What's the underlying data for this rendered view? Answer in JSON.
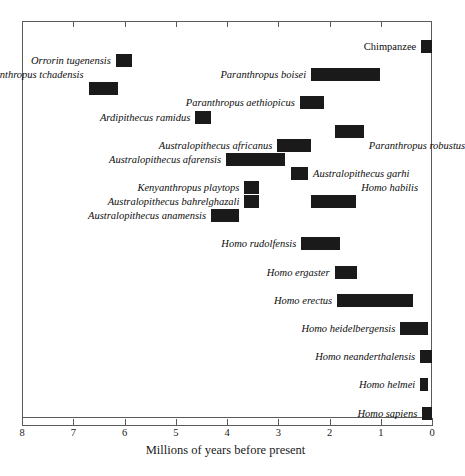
{
  "chart_data": {
    "type": "bar",
    "orientation": "horizontal",
    "title": "",
    "xlabel": "Millions of years before present",
    "ylabel": "",
    "xlim": [
      8,
      0
    ],
    "x_axis_reversed": true,
    "xticks": [
      8,
      7,
      6,
      5,
      4,
      3,
      2,
      1,
      0
    ],
    "xticklabels": [
      "8",
      "7",
      "6",
      "5",
      "4",
      "3",
      "2",
      "1",
      "0"
    ],
    "grid": false,
    "legend": null,
    "bar_color": "#1a1a1a",
    "frame_color": "#5a5a5a",
    "units": "millions of years before present",
    "note": "Each bar is the temporal range (first to last appearance) of a hominin taxon; bars are ordered top-to-bottom roughly oldest first.",
    "categories": [
      "Chimpanzee",
      "Orrorin tugenensis",
      "Sahelanthropus tchadensis",
      "Paranthropus boisei",
      "Paranthropus aethiopicus",
      "Ardipithecus ramidus",
      "Paranthropus robustus",
      "Australopithecus africanus",
      "Australopithecus afarensis",
      "Australopithecus garhi",
      "Kenyanthropus playtops",
      "Australopithecus bahrelghazali",
      "Homo habilis",
      "Australopithecus anamensis",
      "Homo rudolfensis",
      "Homo ergaster",
      "Homo erectus",
      "Homo heidelbergensis",
      "Homo neanderthalensis",
      "Homo helmei",
      "Homo sapiens"
    ],
    "bars": [
      {
        "label": "Chimpanzee",
        "italic": false,
        "start_mya": 0.21,
        "end_mya": 0.0,
        "row": 0,
        "label_side": "left"
      },
      {
        "label": "Orrorin tugenensis",
        "italic": true,
        "start_mya": 6.17,
        "end_mya": 5.85,
        "row": 1,
        "label_side": "left"
      },
      {
        "label": "Sahelanthropus tchadensis",
        "italic": true,
        "start_mya": 6.7,
        "end_mya": 6.12,
        "row": 3,
        "label_side": "left-above"
      },
      {
        "label": "Paranthropus boisei",
        "italic": true,
        "start_mya": 2.36,
        "end_mya": 1.02,
        "row": 2,
        "label_side": "left"
      },
      {
        "label": "Paranthropus aethiopicus",
        "italic": true,
        "start_mya": 2.58,
        "end_mya": 2.1,
        "row": 4,
        "label_side": "left"
      },
      {
        "label": "Ardipithecus ramidus",
        "italic": true,
        "start_mya": 4.62,
        "end_mya": 4.31,
        "row": 5,
        "label_side": "left"
      },
      {
        "label": "Paranthropus robustus",
        "italic": true,
        "start_mya": 1.9,
        "end_mya": 1.33,
        "row": 6,
        "label_side": "right-below"
      },
      {
        "label": "Australopithecus africanus",
        "italic": true,
        "start_mya": 3.02,
        "end_mya": 2.36,
        "row": 7,
        "label_side": "left"
      },
      {
        "label": "Australopithecus afarensis",
        "italic": true,
        "start_mya": 4.02,
        "end_mya": 2.87,
        "row": 8,
        "label_side": "left"
      },
      {
        "label": "Australopithecus garhi",
        "italic": true,
        "start_mya": 2.75,
        "end_mya": 2.42,
        "row": 9,
        "label_side": "right"
      },
      {
        "label": "Kenyanthropus playtops",
        "italic": true,
        "start_mya": 3.66,
        "end_mya": 3.37,
        "row": 10,
        "label_side": "left"
      },
      {
        "label": "Australopithecus bahrelghazali",
        "italic": true,
        "start_mya": 3.66,
        "end_mya": 3.37,
        "row": 11,
        "label_side": "left"
      },
      {
        "label": "Homo habilis",
        "italic": true,
        "start_mya": 2.36,
        "end_mya": 1.48,
        "row": 11,
        "label_side": "right-above"
      },
      {
        "label": "Australopithecus anamensis",
        "italic": true,
        "start_mya": 4.31,
        "end_mya": 3.77,
        "row": 12,
        "label_side": "left"
      },
      {
        "label": "Homo rudolfensis",
        "italic": true,
        "start_mya": 2.55,
        "end_mya": 1.79,
        "row": 14,
        "label_side": "left"
      },
      {
        "label": "Homo ergaster",
        "italic": true,
        "start_mya": 1.9,
        "end_mya": 1.46,
        "row": 16,
        "label_side": "left"
      },
      {
        "label": "Homo erectus",
        "italic": true,
        "start_mya": 1.85,
        "end_mya": 0.37,
        "row": 18,
        "label_side": "left"
      },
      {
        "label": "Homo heidelbergensis",
        "italic": true,
        "start_mya": 0.62,
        "end_mya": 0.08,
        "row": 20,
        "label_side": "left"
      },
      {
        "label": "Homo neanderthalensis",
        "italic": true,
        "start_mya": 0.23,
        "end_mya": 0.0,
        "row": 22,
        "label_side": "left"
      },
      {
        "label": "Homo helmei",
        "italic": true,
        "start_mya": 0.23,
        "end_mya": 0.08,
        "row": 24,
        "label_side": "left"
      },
      {
        "label": "Homo sapiens",
        "italic": true,
        "start_mya": 0.19,
        "end_mya": 0.0,
        "row": 26,
        "label_side": "left"
      }
    ]
  },
  "axis": {
    "title": "Millions of years before present",
    "ticklabels": [
      "8",
      "7",
      "6",
      "5",
      "4",
      "3",
      "2",
      "1",
      "0"
    ]
  }
}
